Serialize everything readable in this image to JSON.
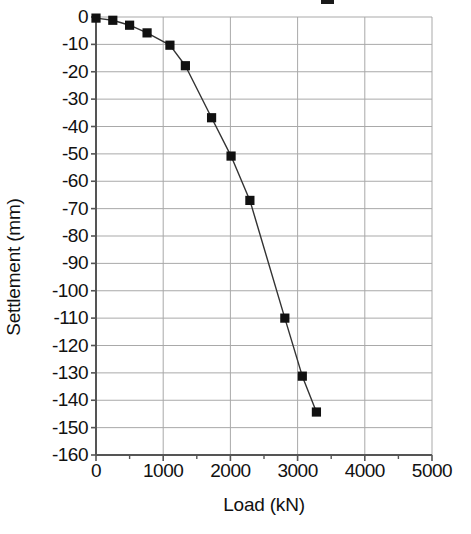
{
  "chart_data": {
    "type": "line",
    "title": "",
    "xlabel": "Load (kN)",
    "ylabel": "Settlement (mm)",
    "xlim": [
      0,
      5000
    ],
    "ylim": [
      -160,
      0
    ],
    "xticks": [
      0,
      1000,
      2000,
      3000,
      4000,
      5000
    ],
    "xtick_labels": [
      "0",
      "1000",
      "2000",
      "3000",
      "4000",
      "5000"
    ],
    "x_minor_tick_interval": 500,
    "yticks": [
      0,
      -10,
      -20,
      -30,
      -40,
      -50,
      -60,
      -70,
      -80,
      -90,
      -100,
      -110,
      -120,
      -130,
      -140,
      -150,
      -160
    ],
    "ytick_labels": [
      "0",
      "-10",
      "-20",
      "-30",
      "-40",
      "-50",
      "-60",
      "-70",
      "-80",
      "-90",
      "-100",
      "-110",
      "-120",
      "-130",
      "-140",
      "-150",
      "-160"
    ],
    "grid": true,
    "grid_color": "#a9a9a9",
    "legend": null,
    "series": [
      {
        "name": "Load-settlement curve",
        "marker": "filled-square",
        "marker_color": "#111111",
        "line_color": "#333333",
        "x": [
          0,
          250,
          500,
          760,
          1100,
          1330,
          1720,
          2010,
          2290,
          2810,
          3070,
          3280
        ],
        "y": [
          -0.4,
          -1.2,
          -3.0,
          -5.8,
          -10.3,
          -17.8,
          -36.8,
          -50.8,
          -67.0,
          -110.0,
          -131.2,
          -144.3
        ]
      }
    ]
  },
  "figure": {
    "background_color": "#ffffff",
    "axis_color": "#555555"
  }
}
